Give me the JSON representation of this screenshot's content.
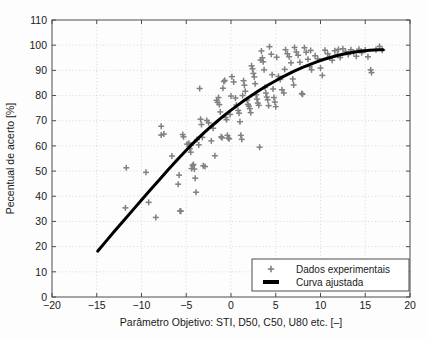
{
  "chart_data": {
    "type": "scatter",
    "title": "",
    "xlabel": "Parâmetro Objetivo: STI, D50, C50, U80 etc. [–]",
    "ylabel": "Pecentual de acerto [%]",
    "xlim": [
      -20,
      20
    ],
    "ylim": [
      0,
      110
    ],
    "xticks": [
      -20,
      -15,
      -10,
      -5,
      0,
      5,
      10,
      15,
      20
    ],
    "xticklabels": [
      "−20",
      "−15",
      "−10",
      "−5",
      "0",
      "5",
      "10",
      "15",
      "20"
    ],
    "yticks": [
      0,
      10,
      20,
      30,
      40,
      50,
      60,
      70,
      80,
      90,
      100,
      110
    ],
    "yticklabels": [
      "0",
      "10",
      "20",
      "30",
      "40",
      "50",
      "60",
      "70",
      "80",
      "90",
      "100",
      "110"
    ],
    "grid": true,
    "grid_style": "dotted",
    "legend_position": "lower right",
    "marker_color": "#808080",
    "curve_color": "#000000",
    "series": [
      {
        "name": "Dados experimentais",
        "type": "scatter",
        "marker": "+",
        "color": "#808080",
        "points": [
          [
            -11.7,
            51.3
          ],
          [
            -11.8,
            35.4
          ],
          [
            -9.5,
            49.5
          ],
          [
            -9.2,
            37.6
          ],
          [
            -8.4,
            31.6
          ],
          [
            -7.8,
            67.8
          ],
          [
            -7.8,
            64.3
          ],
          [
            -7.5,
            64.7
          ],
          [
            -6.6,
            56.0
          ],
          [
            -5.8,
            48.4
          ],
          [
            -5.9,
            44.8
          ],
          [
            -5.6,
            34.1
          ],
          [
            -5.7,
            34.2
          ],
          [
            -5.4,
            64.5
          ],
          [
            -5.3,
            63.6
          ],
          [
            -4.9,
            60.7
          ],
          [
            -4.7,
            61.1
          ],
          [
            -4.6,
            58.9
          ],
          [
            -4.5,
            57.5
          ],
          [
            -4.5,
            60.2
          ],
          [
            -4.3,
            52.2
          ],
          [
            -4.4,
            51.0
          ],
          [
            -4.2,
            52.6
          ],
          [
            -4.1,
            50.8
          ],
          [
            -4.0,
            47.2
          ],
          [
            -3.9,
            41.6
          ],
          [
            -3.8,
            62.5
          ],
          [
            -3.6,
            60.4
          ],
          [
            -3.5,
            82.8
          ],
          [
            -3.4,
            70.6
          ],
          [
            -3.3,
            68.5
          ],
          [
            -3.2,
            63.4
          ],
          [
            -3.1,
            52.1
          ],
          [
            -2.9,
            51.8
          ],
          [
            -2.7,
            70.1
          ],
          [
            -2.5,
            69.2
          ],
          [
            -2.2,
            62.0
          ],
          [
            -1.8,
            56.1
          ],
          [
            -1.6,
            78.1
          ],
          [
            -1.5,
            77.3
          ],
          [
            -1.4,
            79.2
          ],
          [
            -1.3,
            76.4
          ],
          [
            -1.2,
            73.5
          ],
          [
            -1.1,
            63.6
          ],
          [
            -1.0,
            63.2
          ],
          [
            -0.9,
            82.9
          ],
          [
            -0.8,
            85.6
          ],
          [
            -0.7,
            86.0
          ],
          [
            -0.6,
            71.3
          ],
          [
            -0.5,
            70.4
          ],
          [
            -0.4,
            64.2
          ],
          [
            -0.3,
            63.1
          ],
          [
            -0.2,
            62.8
          ],
          [
            0.1,
            87.5
          ],
          [
            0.3,
            85.4
          ],
          [
            0.5,
            79.0
          ],
          [
            0.6,
            76.2
          ],
          [
            0.8,
            74.1
          ],
          [
            0.9,
            73.0
          ],
          [
            1.0,
            69.6
          ],
          [
            1.1,
            64.2
          ],
          [
            1.2,
            62.6
          ],
          [
            1.4,
            85.9
          ],
          [
            1.5,
            84.1
          ],
          [
            1.6,
            81.7
          ],
          [
            1.8,
            78.2
          ],
          [
            1.9,
            76.5
          ],
          [
            2.0,
            75.8
          ],
          [
            2.1,
            74.8
          ],
          [
            2.2,
            73.2
          ],
          [
            2.4,
            90.6
          ],
          [
            2.5,
            88.8
          ],
          [
            2.6,
            87.4
          ],
          [
            2.7,
            84.7
          ],
          [
            2.8,
            80.3
          ],
          [
            2.9,
            78.6
          ],
          [
            3.0,
            77.0
          ],
          [
            3.1,
            76.1
          ],
          [
            3.2,
            59.5
          ],
          [
            3.4,
            97.7
          ],
          [
            3.5,
            95.0
          ],
          [
            3.6,
            93.4
          ],
          [
            3.7,
            90.2
          ],
          [
            3.8,
            83.2
          ],
          [
            3.9,
            81.0
          ],
          [
            4.0,
            79.4
          ],
          [
            4.1,
            78.3
          ],
          [
            4.3,
            99.4
          ],
          [
            4.5,
            96.4
          ],
          [
            4.6,
            88.3
          ],
          [
            4.7,
            82.6
          ],
          [
            4.8,
            79.2
          ],
          [
            4.9,
            77.4
          ],
          [
            5.1,
            95.2
          ],
          [
            5.3,
            87.6
          ],
          [
            5.5,
            86.4
          ],
          [
            5.7,
            82.3
          ],
          [
            5.9,
            81.0
          ],
          [
            6.1,
            98.2
          ],
          [
            6.3,
            96.6
          ],
          [
            6.5,
            95.4
          ],
          [
            6.7,
            93.0
          ],
          [
            6.9,
            86.6
          ],
          [
            7.1,
            99.1
          ],
          [
            7.3,
            97.3
          ],
          [
            7.5,
            96.0
          ],
          [
            7.7,
            93.2
          ],
          [
            7.9,
            80.8
          ],
          [
            8.0,
            80.5
          ],
          [
            8.2,
            99.0
          ],
          [
            8.4,
            97.2
          ],
          [
            8.6,
            94.4
          ],
          [
            8.8,
            91.5
          ],
          [
            9.0,
            90.2
          ],
          [
            9.4,
            95.8
          ],
          [
            9.7,
            94.6
          ],
          [
            10.0,
            90.9
          ],
          [
            10.2,
            88.0
          ],
          [
            10.5,
            98.0
          ],
          [
            10.8,
            96.6
          ],
          [
            11.0,
            95.3
          ],
          [
            11.3,
            94.0
          ],
          [
            11.6,
            97.8
          ],
          [
            11.9,
            96.2
          ],
          [
            12.2,
            95.1
          ],
          [
            12.5,
            98.6
          ],
          [
            12.8,
            97.5
          ],
          [
            13.1,
            96.3
          ],
          [
            13.4,
            98.2
          ],
          [
            13.7,
            97.1
          ],
          [
            14.0,
            95.6
          ],
          [
            14.3,
            98.4
          ],
          [
            14.6,
            97.0
          ],
          [
            15.0,
            98.1
          ],
          [
            15.3,
            95.4
          ],
          [
            15.6,
            90.2
          ],
          [
            15.7,
            89.1
          ],
          [
            16.2,
            98.2
          ],
          [
            16.6,
            99.5
          ],
          [
            16.9,
            98.0
          ],
          [
            2.3,
            91.8
          ],
          [
            3.3,
            94.1
          ],
          [
            6.0,
            90.4
          ],
          [
            7.0,
            84.2
          ],
          [
            1.3,
            80.0
          ],
          [
            0.0,
            79.8
          ],
          [
            -2.0,
            67.0
          ],
          [
            -0.1,
            72.5
          ],
          [
            5.0,
            75.6
          ],
          [
            4.2,
            76.0
          ],
          [
            8.9,
            97.9
          ],
          [
            12.0,
            98.3
          ]
        ]
      },
      {
        "name": "Curva ajustada",
        "type": "line",
        "color": "#000000",
        "linewidth": 3,
        "points": [
          [
            -14.9,
            18.2
          ],
          [
            -14.0,
            22.0
          ],
          [
            -13.0,
            26.2
          ],
          [
            -12.0,
            30.3
          ],
          [
            -11.0,
            34.4
          ],
          [
            -10.0,
            38.5
          ],
          [
            -9.0,
            42.6
          ],
          [
            -8.0,
            46.6
          ],
          [
            -7.0,
            50.6
          ],
          [
            -6.0,
            54.5
          ],
          [
            -5.0,
            58.3
          ],
          [
            -4.5,
            60.1
          ],
          [
            -4.0,
            61.9
          ],
          [
            -3.5,
            63.6
          ],
          [
            -3.0,
            65.3
          ],
          [
            -2.5,
            66.9
          ],
          [
            -2.0,
            68.4
          ],
          [
            -1.5,
            69.9
          ],
          [
            -1.0,
            71.4
          ],
          [
            -0.5,
            72.8
          ],
          [
            0.0,
            74.2
          ],
          [
            0.5,
            75.5
          ],
          [
            1.0,
            76.8
          ],
          [
            1.5,
            78.1
          ],
          [
            2.0,
            79.3
          ],
          [
            2.5,
            80.5
          ],
          [
            3.0,
            81.7
          ],
          [
            3.5,
            82.8
          ],
          [
            4.0,
            83.9
          ],
          [
            4.5,
            84.9
          ],
          [
            5.0,
            85.9
          ],
          [
            5.5,
            86.9
          ],
          [
            6.0,
            87.8
          ],
          [
            6.5,
            88.7
          ],
          [
            7.0,
            89.6
          ],
          [
            7.5,
            90.4
          ],
          [
            8.0,
            91.2
          ],
          [
            8.5,
            91.9
          ],
          [
            9.0,
            92.6
          ],
          [
            9.5,
            93.3
          ],
          [
            10.0,
            93.9
          ],
          [
            10.5,
            94.5
          ],
          [
            11.0,
            95.0
          ],
          [
            11.5,
            95.5
          ],
          [
            12.0,
            96.0
          ],
          [
            12.5,
            96.4
          ],
          [
            13.0,
            96.8
          ],
          [
            13.5,
            97.1
          ],
          [
            14.0,
            97.4
          ],
          [
            14.5,
            97.6
          ],
          [
            15.0,
            97.8
          ],
          [
            15.5,
            98.0
          ],
          [
            16.0,
            98.1
          ],
          [
            16.5,
            98.2
          ],
          [
            17.0,
            98.2
          ]
        ]
      }
    ]
  },
  "legend": {
    "items": [
      {
        "label": "Dados experimentais",
        "marker": "plus-marker"
      },
      {
        "label": "Curva ajustada",
        "marker": "line-marker"
      }
    ]
  }
}
